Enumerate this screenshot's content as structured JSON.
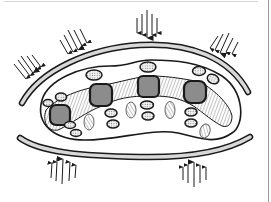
{
  "figure": {
    "description": "Schematic cross-section of a compressed elongated body between two curved walls, with external force arrows",
    "colors": {
      "outline": "#1a1a1a",
      "wall_fill": "#d8d8d8",
      "node_fill": "#8c8c8c",
      "hatch": "#7a7a7a",
      "dotted_fill": "#e9e9e9",
      "background": "#ffffff"
    },
    "arrow_groups": [
      {
        "id": "upper-left",
        "direction": "down-right",
        "count": 5
      },
      {
        "id": "upper-center-left",
        "direction": "down-right",
        "count": 5
      },
      {
        "id": "top-center",
        "direction": "down",
        "count": 5
      },
      {
        "id": "upper-right",
        "direction": "down-left",
        "count": 5
      },
      {
        "id": "bottom-left",
        "direction": "up",
        "count": 5
      },
      {
        "id": "bottom-right",
        "direction": "up",
        "count": 5
      }
    ],
    "nodes": {
      "count": 4,
      "shape": "rounded-square",
      "fill": "gray"
    },
    "walls": {
      "count": 2,
      "labels": [
        "upper-wall",
        "lower-wall"
      ]
    },
    "inclusions": {
      "dotted_ovals": 12,
      "hatched_ovals": 4
    }
  }
}
